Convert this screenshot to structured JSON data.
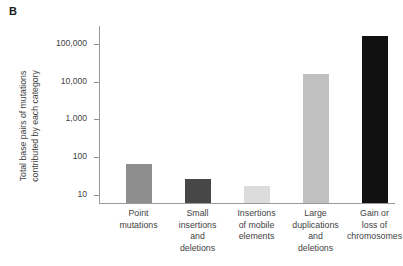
{
  "figure": {
    "panel_label": "B",
    "y_axis_title": "Total base pairs of mutations\ncontributed by each category"
  },
  "chart_data": {
    "type": "bar",
    "title": "",
    "subtitle": "",
    "xlabel": "",
    "ylabel": "Total base pairs of mutations contributed by each category",
    "yscale": "log",
    "ylim": [
      5,
      300000
    ],
    "grid": false,
    "legend": null,
    "ytick_labels": [
      "100,000",
      "10,000",
      "1,000",
      "100",
      "10"
    ],
    "ytick_values": [
      100000,
      10000,
      1000,
      100,
      10
    ],
    "categories": [
      "Point\nmutations",
      "Small\ninsertions\nand\ndeletions",
      "Insertions\nof mobile\nelements",
      "Large\nduplications\nand\ndeletions",
      "Gain or\nloss of\nchromosomes"
    ],
    "values": [
      60,
      24,
      16,
      15000,
      150000
    ],
    "bar_colors": [
      "#8e8e8e",
      "#474747",
      "#dcdcdc",
      "#c0c0c0",
      "#111111"
    ],
    "axis_color": "#9a9a9a"
  }
}
